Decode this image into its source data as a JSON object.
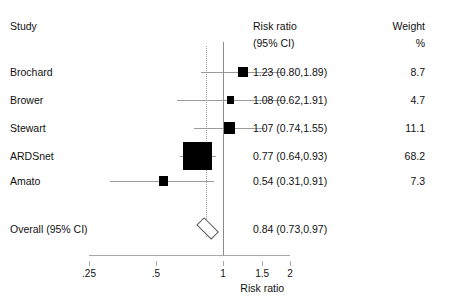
{
  "headers": {
    "study": "Study",
    "estimate_line1": "Risk ratio",
    "estimate_line2": "(95% CI)",
    "weight_line1": "Weight",
    "weight_line2": "%"
  },
  "overall": {
    "label": "Overall (95% CI)",
    "estimate_text": "0.84 (0.73,0.97)",
    "weight_text": ""
  },
  "axis": {
    "title": "Risk ratio",
    "tick_labels": [
      ".25",
      ".5",
      "1",
      "1.5",
      "2"
    ],
    "tick_values": [
      0.25,
      0.5,
      1,
      1.5,
      2
    ],
    "scale": "log",
    "null_value": 1
  },
  "colors": {
    "marker": "#000000",
    "whisker": "#9a9a9a",
    "null_line": "#8c8c8c",
    "pooled_line": "#9a9a9a",
    "axis": "#a8a8a8",
    "text": "#111111",
    "background": "#ffffff"
  },
  "chart_data": {
    "type": "forest",
    "title": "",
    "xlabel": "Risk ratio",
    "ylabel": "",
    "xscale": "log",
    "xlim": [
      0.25,
      2.0
    ],
    "xticks": [
      0.25,
      0.5,
      1,
      1.5,
      2
    ],
    "xticklabels": [
      ".25",
      ".5",
      "1",
      "1.5",
      "2"
    ],
    "effect_measure": "Risk ratio",
    "ci_level": "95%",
    "reference_line": 1,
    "studies": [
      {
        "label": "Brochard",
        "estimate": 1.23,
        "ci_lower": 0.8,
        "ci_upper": 1.89,
        "weight": 8.7,
        "estimate_text": "1.23 (0.80,1.89)",
        "weight_text": "8.7"
      },
      {
        "label": "Brower",
        "estimate": 1.08,
        "ci_lower": 0.62,
        "ci_upper": 1.91,
        "weight": 4.7,
        "estimate_text": "1.08 (0.62,1.91)",
        "weight_text": "4.7"
      },
      {
        "label": "Stewart",
        "estimate": 1.07,
        "ci_lower": 0.74,
        "ci_upper": 1.55,
        "weight": 11.1,
        "estimate_text": "1.07 (0.74,1.55)",
        "weight_text": "11.1"
      },
      {
        "label": "ARDSnet",
        "estimate": 0.77,
        "ci_lower": 0.64,
        "ci_upper": 0.93,
        "weight": 68.2,
        "estimate_text": "0.77 (0.64,0.93)",
        "weight_text": "68.2"
      },
      {
        "label": "Amato",
        "estimate": 0.54,
        "ci_lower": 0.31,
        "ci_upper": 0.91,
        "weight": 7.3,
        "estimate_text": "0.54 (0.31,0.91)",
        "weight_text": "7.3"
      }
    ],
    "pooled": {
      "label": "Overall (95% CI)",
      "estimate": 0.84,
      "ci_lower": 0.73,
      "ci_upper": 0.97,
      "estimate_text": "0.84 (0.73,0.97)"
    }
  }
}
